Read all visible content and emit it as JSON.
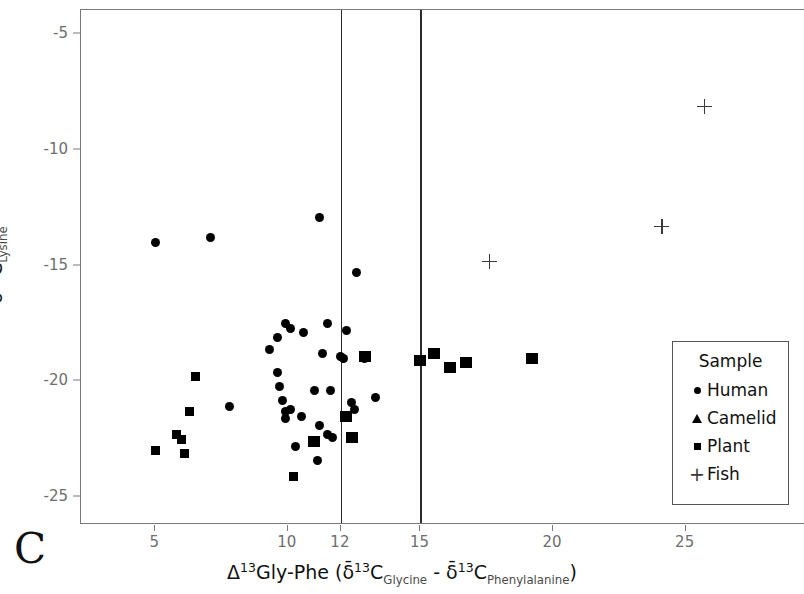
{
  "panel": {
    "label": "C"
  },
  "axes": {
    "x": {
      "title_parts": {
        "delta_symbol": "Δ",
        "sup1": "13",
        "mid": "Gly-Phe (",
        "delta_bar": "δ̄",
        "sup2": "13",
        "c1": "C",
        "sub1": "Glycine",
        "minus": " - ",
        "delta_bar2": "δ̄",
        "sup3": "13",
        "c2": "C",
        "sub2": "Phenylalanine",
        "close": ")"
      },
      "title_text": "Δ13Gly-Phe (δ̄13CGlycine - δ̄13CPhenylalanine)",
      "ticks": [
        5,
        10,
        12,
        15,
        20,
        25
      ],
      "tick_labels": [
        "5",
        "10",
        "12",
        "15",
        "20",
        "25"
      ],
      "min": 2.2,
      "max": 29.5
    },
    "y": {
      "title_parts": {
        "delta_bar": "δ̄",
        "sup": "13",
        "c": "C",
        "sub": "Lysine"
      },
      "title_text": "δ̄13CLysine",
      "ticks": [
        -5,
        -10,
        -15,
        -20,
        -25
      ],
      "tick_labels": [
        "-5",
        "-10",
        "-15",
        "-20",
        "-25"
      ],
      "min": -26.2,
      "max": -3.95
    }
  },
  "reference_lines": {
    "x_values": [
      12,
      15
    ],
    "color": "#2b2b2b"
  },
  "legend": {
    "title": "Sample",
    "position": "bottom-right",
    "entries": [
      {
        "label": "Human",
        "marker": "circle",
        "icon": "circle-marker-icon"
      },
      {
        "label": "Camelid",
        "marker": "triangle",
        "icon": "triangle-marker-icon"
      },
      {
        "label": "Plant",
        "marker": "square",
        "icon": "square-marker-icon"
      },
      {
        "label": "Fish",
        "marker": "plus",
        "icon": "plus-marker-icon"
      }
    ]
  },
  "chart_data": {
    "type": "scatter",
    "title": "",
    "xlabel": "Δ13Gly-Phe (δ̄13CGlycine - δ̄13CPhenylalanine)",
    "ylabel": "δ̄13CLysine",
    "xlim": [
      2.2,
      29.5
    ],
    "ylim": [
      -26.2,
      -3.95
    ],
    "grid": false,
    "legend_position": "bottom-right",
    "annotations": [
      {
        "type": "vline",
        "x": 12
      },
      {
        "type": "vline",
        "x": 15
      },
      {
        "type": "panel-label",
        "text": "C"
      }
    ],
    "series": [
      {
        "name": "Human",
        "marker": "circle",
        "color": "#000000",
        "points": [
          [
            5.0,
            -14.0
          ],
          [
            7.1,
            -13.8
          ],
          [
            11.2,
            -12.9
          ],
          [
            12.6,
            -15.3
          ],
          [
            9.9,
            -17.5
          ],
          [
            10.1,
            -17.7
          ],
          [
            9.6,
            -18.1
          ],
          [
            11.5,
            -17.5
          ],
          [
            12.2,
            -17.8
          ],
          [
            10.6,
            -17.9
          ],
          [
            9.3,
            -18.6
          ],
          [
            11.3,
            -18.8
          ],
          [
            12.0,
            -18.9
          ],
          [
            12.1,
            -19.0
          ],
          [
            7.8,
            -21.1
          ],
          [
            9.6,
            -19.6
          ],
          [
            9.7,
            -20.2
          ],
          [
            9.8,
            -20.8
          ],
          [
            10.1,
            -21.2
          ],
          [
            11.0,
            -20.4
          ],
          [
            11.6,
            -20.4
          ],
          [
            12.4,
            -20.9
          ],
          [
            12.5,
            -21.2
          ],
          [
            9.9,
            -21.3
          ],
          [
            9.9,
            -21.6
          ],
          [
            10.5,
            -21.5
          ],
          [
            11.2,
            -21.9
          ],
          [
            11.5,
            -22.3
          ],
          [
            11.7,
            -22.4
          ],
          [
            10.3,
            -22.8
          ],
          [
            11.1,
            -23.4
          ],
          [
            13.3,
            -20.7
          ],
          [
            12.9,
            -19.0
          ]
        ]
      },
      {
        "name": "Camelid",
        "marker": "triangle",
        "color": "#000000",
        "points": [
          [
            11.0,
            -22.6
          ],
          [
            12.2,
            -21.5
          ],
          [
            12.4,
            -22.4
          ],
          [
            12.9,
            -18.9
          ],
          [
            15.0,
            -19.1
          ],
          [
            15.5,
            -18.8
          ],
          [
            16.1,
            -19.4
          ],
          [
            16.7,
            -19.2
          ],
          [
            19.2,
            -19.0
          ]
        ]
      },
      {
        "name": "Plant",
        "marker": "square",
        "color": "#000000",
        "points": [
          [
            5.0,
            -23.0
          ],
          [
            6.1,
            -23.1
          ],
          [
            5.8,
            -22.3
          ],
          [
            6.0,
            -22.5
          ],
          [
            6.3,
            -21.3
          ],
          [
            6.5,
            -19.8
          ],
          [
            10.2,
            -24.1
          ]
        ]
      },
      {
        "name": "Fish",
        "marker": "plus",
        "color": "#3a3a3a",
        "points": [
          [
            17.6,
            -14.8
          ],
          [
            24.1,
            -13.3
          ],
          [
            25.7,
            -8.1
          ]
        ]
      }
    ]
  }
}
